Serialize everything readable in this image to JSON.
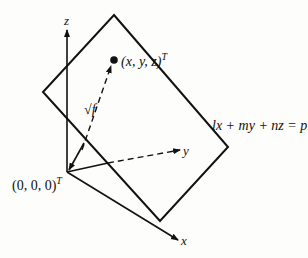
{
  "diagram": {
    "title": "",
    "axes": {
      "x_label": "x",
      "y_label": "y",
      "z_label": "z"
    },
    "origin_label": "(0, 0, 0)",
    "origin_superscript": "T",
    "point_label": "(x, y, z)",
    "point_superscript": "T",
    "distance_label": "√f",
    "plane_equation": "lx + my + nz = p",
    "colors": {
      "ink": "#111111",
      "background": "#fdfdfb"
    }
  }
}
